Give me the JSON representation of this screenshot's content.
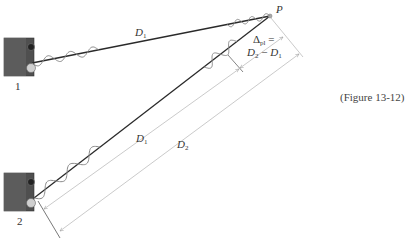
{
  "figure": {
    "caption": "(Figure 13-12)",
    "point_label": "P",
    "speaker_1_label": "1",
    "speaker_2_label": "2",
    "path1_label": {
      "main": "D",
      "sub": "1"
    },
    "dim_d1_label": {
      "main": "D",
      "sub": "1"
    },
    "dim_d2_label": {
      "main": "D",
      "sub": "2"
    },
    "delta_label": {
      "line1_main": "Δ",
      "line1_sub": "pl",
      "line1_tail": " =",
      "line2_a_main": "D",
      "line2_a_sub": "2",
      "line2_mid": " − ",
      "line2_b_main": "D",
      "line2_b_sub": "1"
    },
    "colors": {
      "path_line": "#2a2a2a",
      "wave": "#8a8a8a",
      "dimension_line": "#b8b8b8",
      "speaker_body": "#4a4a4a"
    }
  }
}
